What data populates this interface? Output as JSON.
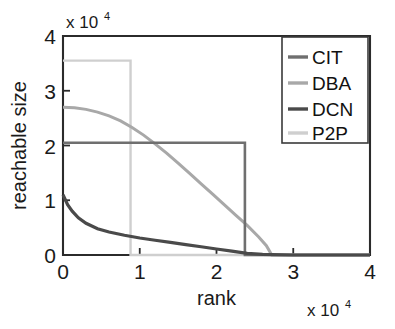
{
  "chart_data": {
    "type": "line",
    "title": "",
    "xlabel": "rank",
    "ylabel": "reachable size",
    "x_multiplier": "x 10",
    "x_multiplier_exp": "4",
    "y_multiplier": "x 10",
    "y_multiplier_exp": "4",
    "xlim": [
      0,
      4
    ],
    "ylim": [
      0,
      4
    ],
    "xticks": [
      0,
      1,
      2,
      3,
      4
    ],
    "yticks": [
      0,
      1,
      2,
      3,
      4
    ],
    "xticklabels": [
      "0",
      "1",
      "2",
      "3",
      "4"
    ],
    "yticklabels": [
      "0",
      "1",
      "2",
      "3",
      "4"
    ],
    "grid": false,
    "legend_position": "top-right",
    "units_note": "axis values are in units of 10^4",
    "series": [
      {
        "name": "CIT",
        "color": "#6f6f6f",
        "linewidth": 2.6,
        "shape": "step",
        "description": "flat plateau at 2.05e4 from rank 0 to 2.37e4 then vertical drop to 0",
        "x": [
          0.0,
          0.3,
          0.6,
          0.9,
          1.2,
          1.5,
          1.8,
          2.1,
          2.37,
          2.37,
          2.6,
          4.0
        ],
        "y": [
          2.05,
          2.05,
          2.05,
          2.05,
          2.05,
          2.05,
          2.05,
          2.05,
          2.05,
          0.0,
          0.0,
          0.0
        ]
      },
      {
        "name": "DBA",
        "color": "#a8a8a8",
        "linewidth": 3.0,
        "shape": "sigmoid-decay",
        "description": "smooth S-shaped decline from 2.70e4 at rank 0 to 0 at rank 2.72e4",
        "x": [
          0.0,
          0.15,
          0.3,
          0.45,
          0.6,
          0.75,
          0.9,
          1.05,
          1.2,
          1.35,
          1.5,
          1.65,
          1.8,
          1.95,
          2.1,
          2.25,
          2.4,
          2.55,
          2.65,
          2.72,
          4.0
        ],
        "y": [
          2.7,
          2.69,
          2.66,
          2.61,
          2.54,
          2.45,
          2.33,
          2.19,
          2.03,
          1.86,
          1.68,
          1.49,
          1.3,
          1.11,
          0.92,
          0.73,
          0.54,
          0.33,
          0.17,
          0.0,
          0.0
        ]
      },
      {
        "name": "DCN",
        "color": "#4a4a4a",
        "linewidth": 3.2,
        "shape": "power-decay",
        "description": "sharp decay from 1.10e4 at rank 0, long tail approaching 0 near rank 2.4e4",
        "x": [
          0.0,
          0.06,
          0.12,
          0.2,
          0.3,
          0.45,
          0.6,
          0.8,
          1.0,
          1.2,
          1.4,
          1.6,
          1.8,
          2.0,
          2.2,
          2.4,
          2.6,
          3.0,
          4.0
        ],
        "y": [
          1.1,
          0.92,
          0.8,
          0.68,
          0.58,
          0.48,
          0.42,
          0.36,
          0.31,
          0.27,
          0.23,
          0.19,
          0.15,
          0.11,
          0.07,
          0.03,
          0.01,
          0.0,
          0.0
        ]
      },
      {
        "name": "P2P",
        "color": "#cfcfcf",
        "linewidth": 2.4,
        "shape": "step",
        "description": "flat plateau at 3.55e4 from rank 0 to 0.88e4 then vertical drop to 0",
        "x": [
          0.0,
          0.2,
          0.4,
          0.6,
          0.88,
          0.88,
          1.2,
          4.0
        ],
        "y": [
          3.55,
          3.55,
          3.55,
          3.55,
          3.55,
          0.0,
          0.0,
          0.0
        ]
      }
    ],
    "legend": [
      {
        "label": "CIT",
        "color": "#6f6f6f"
      },
      {
        "label": "DBA",
        "color": "#a8a8a8"
      },
      {
        "label": "DCN",
        "color": "#4a4a4a"
      },
      {
        "label": "P2P",
        "color": "#cfcfcf"
      }
    ]
  },
  "axis": {
    "frame_color": "#2b2b2b"
  }
}
